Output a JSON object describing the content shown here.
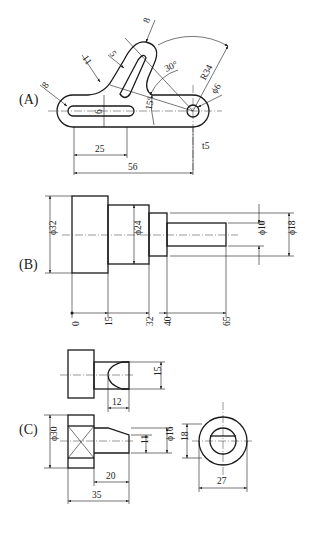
{
  "parts": [
    {
      "label": "(A)",
      "dimensions": {
        "slot_radius_left": "8",
        "fillet_radius": "11",
        "curved_slot_width": "5",
        "arm_end_width": "8",
        "angle_upper": "30°",
        "angle_lower": "15°",
        "radius": "R34",
        "hole_diameter": "ϕ6",
        "slot_width": "6",
        "slot_length": "25",
        "overall_length": "56",
        "thickness": "t5"
      }
    },
    {
      "label": "(B)",
      "dimensions": {
        "dia_large": "ϕ32",
        "dia_mid": "ϕ24",
        "dia_small": "ϕ10",
        "dia_step": "ϕ18",
        "positions": [
          "0",
          "15",
          "32",
          "40",
          "65"
        ]
      }
    },
    {
      "label": "(C)",
      "dimensions": {
        "top_height": "15",
        "top_length": "12",
        "dia_head": "ϕ30",
        "flat_height": "11",
        "dia_shaft": "ϕ16",
        "side_height": "18",
        "shaft_length": "20",
        "overall_length": "35",
        "side_width": "27"
      }
    }
  ]
}
